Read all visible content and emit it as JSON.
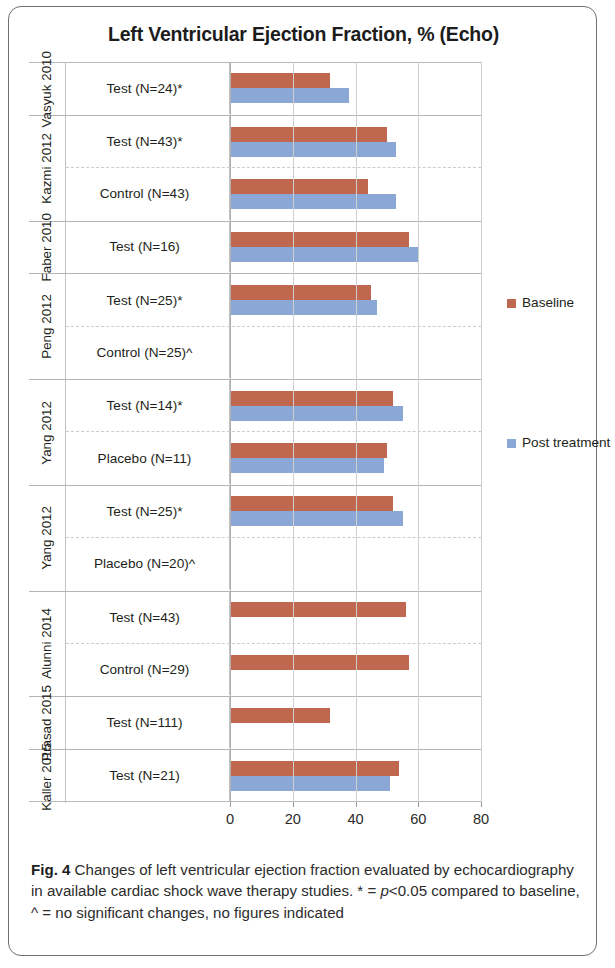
{
  "figure": {
    "title": "Left Ventricular Ejection Fraction, % (Echo)",
    "caption_label": "Fig. 4",
    "caption_part1": " Changes of left ventricular ejection fraction evaluated by echocardiography in available cardiac shock wave therapy studies. * = ",
    "caption_italic": "p",
    "caption_part2": "<0.05 compared to baseline, ^ = no significant changes, no figures indicated"
  },
  "legend": {
    "items": [
      {
        "label": "Baseline",
        "color": "#c0684f",
        "key": "baseline"
      },
      {
        "label": "Post treatment",
        "color": "#8ba7d6",
        "key": "post"
      }
    ]
  },
  "axis": {
    "ticks": [
      "0",
      "20",
      "40",
      "60",
      "80"
    ],
    "min": 0,
    "max": 80
  },
  "chart_data": {
    "type": "bar",
    "orientation": "horizontal",
    "title": "Left Ventricular Ejection Fraction, % (Echo)",
    "xlabel": "",
    "ylabel": "",
    "xlim": [
      0,
      80
    ],
    "xticks": [
      0,
      20,
      40,
      60,
      80
    ],
    "grid": "vertical",
    "legend_position": "right",
    "series": [
      {
        "name": "Baseline",
        "color": "#c0684f"
      },
      {
        "name": "Post treatment",
        "color": "#8ba7d6"
      }
    ],
    "groups": [
      {
        "study": "Vasyuk 2010",
        "rows": [
          {
            "label": "Test (N=24)*",
            "baseline": 32,
            "post": 38
          }
        ]
      },
      {
        "study": "Kazmi 2012",
        "rows": [
          {
            "label": "Test (N=43)*",
            "baseline": 50,
            "post": 53
          },
          {
            "label": "Control (N=43)",
            "baseline": 44,
            "post": 53
          }
        ]
      },
      {
        "study": "Faber 2010",
        "rows": [
          {
            "label": "Test (N=16)",
            "baseline": 57,
            "post": 60
          }
        ]
      },
      {
        "study": "Peng 2012",
        "rows": [
          {
            "label": "Test (N=25)*",
            "baseline": 45,
            "post": 47
          },
          {
            "label": "Control (N=25)^",
            "baseline": null,
            "post": null
          }
        ]
      },
      {
        "study": "Yang 2012",
        "rows": [
          {
            "label": "Test (N=14)*",
            "baseline": 52,
            "post": 55
          },
          {
            "label": "Placebo (N=11)",
            "baseline": 50,
            "post": 49
          }
        ]
      },
      {
        "study": "Yang 2012",
        "rows": [
          {
            "label": "Test (N=25)*",
            "baseline": 52,
            "post": 55
          },
          {
            "label": "Placebo (N=20)^",
            "baseline": null,
            "post": null
          }
        ]
      },
      {
        "study": "Alunni 2014",
        "rows": [
          {
            "label": "Test (N=43)",
            "baseline": 56,
            "post": null
          },
          {
            "label": "Control (N=29)",
            "baseline": 57,
            "post": null
          }
        ]
      },
      {
        "study": "Prasad 2015",
        "rows": [
          {
            "label": "Test (N=111)",
            "baseline": 32,
            "post": null
          }
        ]
      },
      {
        "study": "Kaller 2015",
        "rows": [
          {
            "label": "Test (N=21)",
            "baseline": 54,
            "post": 51
          }
        ]
      }
    ]
  }
}
